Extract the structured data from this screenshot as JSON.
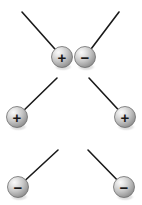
{
  "canvas": {
    "width": 142,
    "height": 205,
    "background": "#ffffff"
  },
  "style": {
    "sphere_radius": 10.5,
    "sphere_highlight_color": "#f2f2f2",
    "sphere_mid_color": "#bdbdbd",
    "sphere_edge_color": "#828282",
    "sphere_outline_color": "#6e6e6e",
    "sign_color": "#1a1a1a",
    "rod_color": "#1a1a1a",
    "rod_width": 1.6,
    "shadow_color": "#c9c9c9"
  },
  "diagram": {
    "rows": [
      {
        "row_label": "row-1",
        "objects": [
          {
            "id": "sphere-1",
            "charge": "+",
            "charge_name": "positive",
            "sign_glyph": "+",
            "cx": 62,
            "cy": 57,
            "rod_x2": 22,
            "rod_y2": 12,
            "rod_direction": "up-left"
          },
          {
            "id": "sphere-2",
            "charge": "-",
            "charge_name": "negative",
            "sign_glyph": "−",
            "cx": 85,
            "cy": 57,
            "rod_x2": 119,
            "rod_y2": 12,
            "rod_direction": "up-right"
          }
        ]
      },
      {
        "row_label": "row-2",
        "objects": [
          {
            "id": "sphere-3",
            "charge": "+",
            "charge_name": "positive",
            "sign_glyph": "+",
            "cx": 17,
            "cy": 117,
            "rod_x2": 57,
            "rod_y2": 78,
            "rod_direction": "up-right"
          },
          {
            "id": "sphere-4",
            "charge": "+",
            "charge_name": "positive",
            "sign_glyph": "+",
            "cx": 125,
            "cy": 117,
            "rod_x2": 89,
            "rod_y2": 78,
            "rod_direction": "up-left"
          }
        ]
      },
      {
        "row_label": "row-3",
        "objects": [
          {
            "id": "sphere-5",
            "charge": "-",
            "charge_name": "negative",
            "sign_glyph": "−",
            "cx": 18,
            "cy": 187,
            "rod_x2": 58,
            "rod_y2": 150,
            "rod_direction": "up-right"
          },
          {
            "id": "sphere-6",
            "charge": "-",
            "charge_name": "negative",
            "sign_glyph": "−",
            "cx": 124,
            "cy": 187,
            "rod_x2": 88,
            "rod_y2": 150,
            "rod_direction": "up-left"
          }
        ]
      }
    ]
  }
}
